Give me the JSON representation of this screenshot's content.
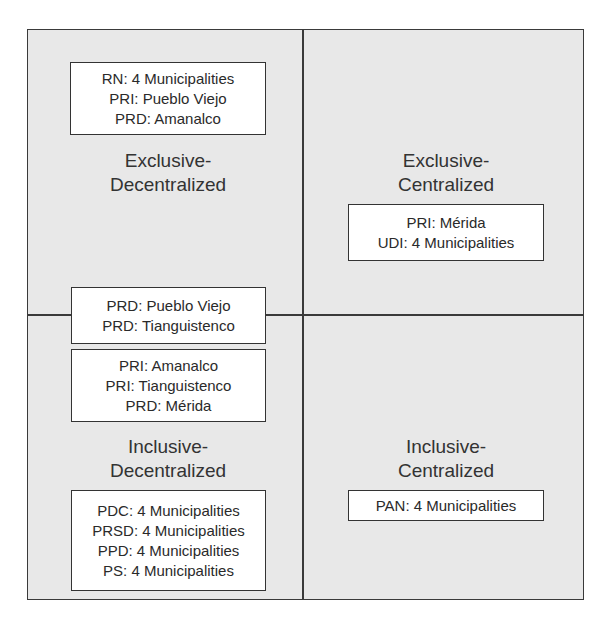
{
  "quadrants": {
    "exclusive_decentralized": {
      "label_line1": "Exclusive-",
      "label_line2": "Decentralized",
      "boxes": [
        [
          "RN: 4 Municipalities",
          "PRI: Pueblo Viejo",
          "PRD: Amanalco"
        ]
      ]
    },
    "exclusive_centralized": {
      "label_line1": "Exclusive-",
      "label_line2": "Centralized",
      "boxes": [
        [
          "PRI: Mérida",
          "UDI: 4 Municipalities"
        ]
      ]
    },
    "boundary": {
      "boxes": [
        [
          "PRD: Pueblo Viejo",
          "PRD: Tianguistenco"
        ]
      ]
    },
    "inclusive_decentralized": {
      "label_line1": "Inclusive-",
      "label_line2": "Decentralized",
      "boxes": [
        [
          "PRI: Amanalco",
          "PRI: Tianguistenco",
          "PRD: Mérida"
        ],
        [
          "PDC: 4 Municipalities",
          "PRSD: 4 Municipalities",
          "PPD: 4 Municipalities",
          "PS: 4 Municipalities"
        ]
      ]
    },
    "inclusive_centralized": {
      "label_line1": "Inclusive-",
      "label_line2": "Centralized",
      "boxes": [
        [
          "PAN: 4 Municipalities"
        ]
      ]
    }
  }
}
